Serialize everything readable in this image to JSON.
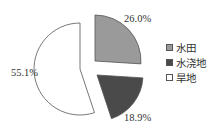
{
  "chart_data": {
    "type": "pie",
    "title": "",
    "categories": [
      "水田",
      "水浇地",
      "旱地"
    ],
    "values": [
      26.0,
      18.9,
      55.1
    ],
    "labels": [
      "26.0%",
      "18.9%",
      "55.1%"
    ],
    "colors": [
      "#9a9a9a",
      "#4a4a4a",
      "#ffffff"
    ],
    "exploded": true,
    "start_angle_deg": 0,
    "direction": "clockwise",
    "legend_position": "right"
  },
  "legend": {
    "items": [
      {
        "label": "水田",
        "color": "#9a9a9a"
      },
      {
        "label": "水浇地",
        "color": "#4a4a4a"
      },
      {
        "label": "旱地",
        "color": "#ffffff"
      }
    ]
  }
}
